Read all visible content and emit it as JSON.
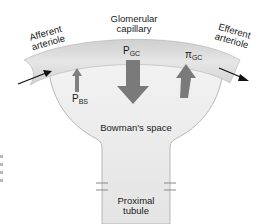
{
  "diagram": {
    "title_labels": {
      "glomerular_capillary_line1": "Glomerular",
      "glomerular_capillary_line2": "capillary",
      "afferent_line1": "Afferent",
      "afferent_line2": "arteriole",
      "efferent_line1": "Efferent",
      "efferent_line2": "arteriole",
      "bowmans_space": "Bowman's space",
      "proximal_line1": "Proximal",
      "proximal_line2": "tubule"
    },
    "forces": [
      {
        "symbol": "P",
        "subscript": "GC",
        "direction": "down",
        "size": "large"
      },
      {
        "symbol": "P",
        "subscript": "BS",
        "direction": "up",
        "size": "small"
      },
      {
        "symbol": "π",
        "subscript": "GC",
        "direction": "up",
        "size": "medium"
      }
    ],
    "flow_arrows": [
      {
        "name": "afferent-inflow",
        "direction": "right-up"
      },
      {
        "name": "efferent-outflow",
        "direction": "right-down"
      }
    ],
    "colors": {
      "capillary_fill": "#d9d9d9",
      "bowman_fill": "#ececec",
      "arrow_gray": "#7a7a7a",
      "outline": "#9a9a9a",
      "text": "#1a1a1a"
    }
  }
}
